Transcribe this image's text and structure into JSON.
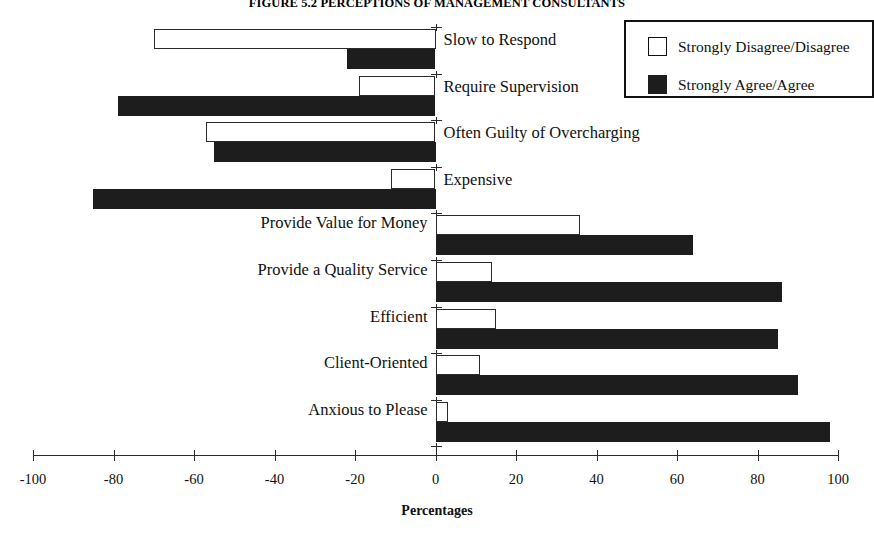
{
  "chart_data": {
    "type": "bar",
    "orientation": "horizontal",
    "title": "FIGURE 5.2 PERCEPTIONS OF MANAGEMENT CONSULTANTS",
    "xlabel": "Percentages",
    "ylabel": "",
    "xlim": [
      -100,
      100
    ],
    "xticks": [
      -100,
      -80,
      -60,
      -40,
      -20,
      0,
      20,
      40,
      60,
      80,
      100
    ],
    "xtick_labels": [
      "-100",
      "-80",
      "-60",
      "-40",
      "-20",
      "0",
      "20",
      "40",
      "60",
      "80",
      "100"
    ],
    "grid": false,
    "legend_position": "top-right",
    "categories": [
      "Slow to Respond",
      "Require Supervision",
      "Often Guilty of Overcharging",
      "Expensive",
      "Provide Value for Money",
      "Provide a Quality Service",
      "Efficient",
      "Client-Oriented",
      "Anxious to Please"
    ],
    "series": [
      {
        "name": "Strongly Disagree/Disagree",
        "color": "#ffffff",
        "values": [
          -70,
          -19,
          -57,
          -11,
          36,
          14,
          15,
          11,
          3
        ]
      },
      {
        "name": "Strongly Agree/Agree",
        "color": "#1d1d1d",
        "values": [
          -22,
          -79,
          -55,
          -85,
          64,
          86,
          85,
          90,
          98
        ]
      }
    ]
  },
  "legend": {
    "items": [
      {
        "label": "Strongly Disagree/Disagree",
        "swatch": "disagree"
      },
      {
        "label": "Strongly Agree/Agree",
        "swatch": "agree"
      }
    ]
  },
  "axis": {
    "title": "Percentages"
  }
}
